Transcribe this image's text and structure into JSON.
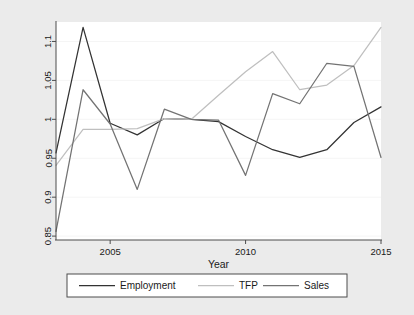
{
  "figure": {
    "background_color": "#ebebeb",
    "plot_background_color": "#ffffff",
    "axis_color": "#4d4d4d",
    "grid_color": "#f2f2f2"
  },
  "chart_data": {
    "type": "line",
    "title": "",
    "subtitle": "",
    "xlabel": "Year",
    "ylabel": "",
    "xlim": [
      2003,
      2015
    ],
    "ylim": [
      0.845,
      1.125
    ],
    "xticks": [
      2005,
      2010,
      2015
    ],
    "xtick_labels": [
      "2005",
      "2010",
      "2015"
    ],
    "yticks": [
      0.85,
      0.9,
      0.95,
      1,
      1.05,
      1.1
    ],
    "ytick_labels": [
      "0.85",
      "0.9",
      "0.95",
      "1",
      "1.05",
      "1.1"
    ],
    "grid": true,
    "grid_axis": "y",
    "legend_position": "bottom-outside",
    "x": [
      2003,
      2004,
      2005,
      2006,
      2007,
      2008,
      2009,
      2010,
      2011,
      2012,
      2013,
      2014,
      2015
    ],
    "series": [
      {
        "name": "Employment",
        "color": "#333333",
        "values": [
          0.957,
          1.118,
          0.995,
          0.98,
          1.001,
          1.0,
          0.997,
          0.978,
          0.961,
          0.951,
          0.961,
          0.996,
          1.016
        ]
      },
      {
        "name": "TFP",
        "color": "#bfbfbf",
        "values": [
          0.941,
          0.987,
          0.987,
          0.988,
          1.001,
          1.0,
          1.031,
          1.061,
          1.087,
          1.038,
          1.044,
          1.069,
          1.032
        ]
      },
      {
        "name": "Sales",
        "color": "#737373",
        "values": [
          0.856,
          1.038,
          0.994,
          0.91,
          1.013,
          1.0,
          0.999,
          0.928,
          1.033,
          1.02,
          1.072,
          1.068,
          0.966
        ]
      }
    ],
    "series_overrides": {
      "TFP_2015": 1.118,
      "Sales_2015": 0.951,
      "Employment_2015": 1.016
    }
  },
  "legend": {
    "items": [
      {
        "label": "Employment",
        "color": "#333333"
      },
      {
        "label": "TFP",
        "color": "#bfbfbf"
      },
      {
        "label": "Sales",
        "color": "#737373"
      }
    ]
  },
  "axes": {
    "x_title": "Year"
  }
}
